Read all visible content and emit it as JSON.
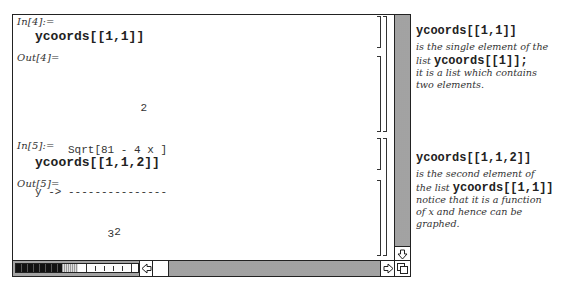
{
  "notebook": {
    "cells": [
      {
        "in_label": "In[4]:=",
        "input": "ycoords[[1,1]]",
        "out_label": "Out[4]=",
        "output_lines": [
          "                2",
          "     Sqrt[81 - 4 x ]",
          "y -> ---------------",
          "           3"
        ]
      },
      {
        "in_label": "In[5]:=",
        "input": "ycoords[[1,1,2]]",
        "out_label": "Out[5]=",
        "output_lines": [
          "            2",
          "Sqrt[81 - 4 x ]",
          "---------------",
          "       3"
        ]
      }
    ]
  },
  "scrollbars": {
    "vertical": {
      "down_arrow": "⇩"
    },
    "horizontal": {
      "left_arrow": "⇦",
      "right_arrow": "⇨"
    }
  },
  "annotations": [
    {
      "heading": "ycoords[[1,1]]",
      "line1": "is the single element of the",
      "line2_prefix": "list ",
      "line2_code": "ycoords[[1]];",
      "line3": "it is a list which contains",
      "line4": "two elements."
    },
    {
      "heading": "ycoords[[1,1,2]]",
      "line1": "is the second element of",
      "line2_prefix": "the list ",
      "line2_code": "ycoords[[1,1]]",
      "line3": "notice that it is a function",
      "line4": "of x and hence can be",
      "line5": "graphed."
    }
  ]
}
